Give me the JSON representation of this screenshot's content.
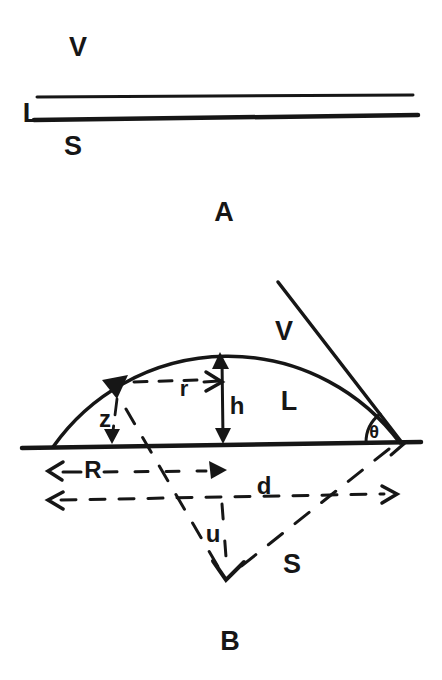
{
  "colors": {
    "background": "#ffffff",
    "ink": "#161616"
  },
  "figure_a": {
    "caption": "A",
    "labels": {
      "vapor": "V",
      "liquid": "L",
      "substrate": "S"
    }
  },
  "figure_b": {
    "caption": "B",
    "labels": {
      "vapor": "V",
      "liquid": "L",
      "substrate": "S",
      "contact_angle": "θ",
      "drop_height": "h",
      "radius_at_height_z": "r",
      "height_z": "z",
      "base_radius": "R",
      "base_diameter": "d",
      "center_depth": "u"
    }
  }
}
